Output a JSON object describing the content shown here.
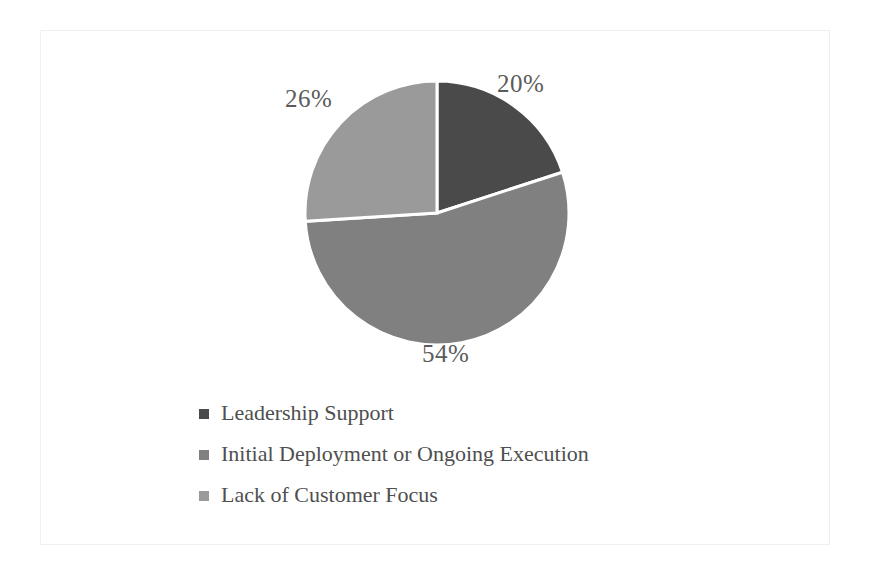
{
  "chart_data": {
    "type": "pie",
    "title": "",
    "categories": [
      "Leadership Support",
      "Initial Deployment or Ongoing Execution",
      "Lack of Customer Focus"
    ],
    "values": [
      20,
      54,
      26
    ],
    "data_labels": [
      "20%",
      "54%",
      "26%"
    ],
    "colors": [
      "#4a4a4a",
      "#808080",
      "#9a9a9a"
    ],
    "label_color": "#5b5b5b",
    "background": "#ffffff",
    "slice_border_color": "#ffffff",
    "start_angle_deg": 0,
    "direction": "clockwise",
    "legend_position": "bottom-left",
    "grid": false,
    "xlabel": "",
    "ylabel": ""
  },
  "slices": [
    {
      "label": "Leadership Support",
      "percent_text": "20%",
      "value": 20,
      "color": "#4a4a4a"
    },
    {
      "label": "Initial Deployment or Ongoing Execution",
      "percent_text": "54%",
      "value": 54,
      "color": "#808080"
    },
    {
      "label": "Lack of Customer Focus",
      "percent_text": "26%",
      "value": 26,
      "color": "#9a9a9a"
    }
  ],
  "legend": {
    "items": [
      {
        "label": "Leadership Support",
        "color": "#4a4a4a"
      },
      {
        "label": "Initial Deployment or Ongoing Execution",
        "color": "#808080"
      },
      {
        "label": "Lack of Customer Focus",
        "color": "#9a9a9a"
      }
    ]
  }
}
